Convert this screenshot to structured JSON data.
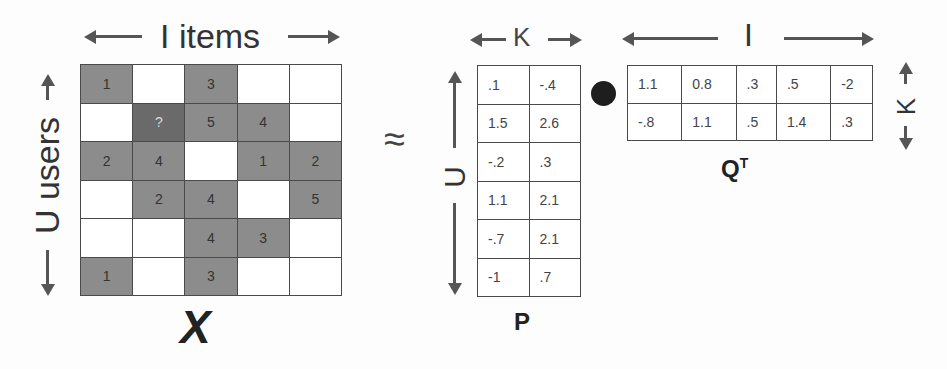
{
  "X": {
    "top_label": "I items",
    "side_label": "U users",
    "name": "X",
    "cells": [
      [
        {
          "v": "1",
          "t": "filled"
        },
        {
          "v": "",
          "t": "empty"
        },
        {
          "v": "3",
          "t": "filled"
        },
        {
          "v": "",
          "t": "empty"
        },
        {
          "v": "",
          "t": "empty"
        }
      ],
      [
        {
          "v": "",
          "t": "empty"
        },
        {
          "v": "?",
          "t": "query"
        },
        {
          "v": "5",
          "t": "filled"
        },
        {
          "v": "4",
          "t": "filled"
        },
        {
          "v": "",
          "t": "empty"
        }
      ],
      [
        {
          "v": "2",
          "t": "filled"
        },
        {
          "v": "4",
          "t": "filled"
        },
        {
          "v": "",
          "t": "empty"
        },
        {
          "v": "1",
          "t": "filled"
        },
        {
          "v": "2",
          "t": "filled"
        }
      ],
      [
        {
          "v": "",
          "t": "empty"
        },
        {
          "v": "2",
          "t": "filled"
        },
        {
          "v": "4",
          "t": "filled"
        },
        {
          "v": "",
          "t": "empty"
        },
        {
          "v": "5",
          "t": "filled"
        }
      ],
      [
        {
          "v": "",
          "t": "empty"
        },
        {
          "v": "",
          "t": "empty"
        },
        {
          "v": "4",
          "t": "filled"
        },
        {
          "v": "3",
          "t": "filled"
        },
        {
          "v": "",
          "t": "empty"
        }
      ],
      [
        {
          "v": "1",
          "t": "filled"
        },
        {
          "v": "",
          "t": "empty"
        },
        {
          "v": "3",
          "t": "filled"
        },
        {
          "v": "",
          "t": "empty"
        },
        {
          "v": "",
          "t": "empty"
        }
      ]
    ]
  },
  "approx_symbol": "≈",
  "P": {
    "top_label": "K",
    "side_label": "U",
    "name": "P",
    "cells": [
      [
        ".1",
        "-.4"
      ],
      [
        "1.5",
        "2.6"
      ],
      [
        "-.2",
        ".3"
      ],
      [
        "1.1",
        "2.1"
      ],
      [
        "-.7",
        "2.1"
      ],
      [
        "-1",
        ".7"
      ]
    ]
  },
  "dot_symbol": "●",
  "QT": {
    "top_label": "I",
    "side_label": "K",
    "name": "Q",
    "superscript": "T",
    "cells": [
      [
        "1.1",
        "0.8",
        ".3",
        ".5",
        "-2"
      ],
      [
        "-.8",
        "1.1",
        ".5",
        "1.4",
        ".3"
      ]
    ]
  },
  "colors": {
    "filled": "#8c8c8c",
    "query": "#6a6a6a",
    "line": "#4a4a4a",
    "arrow": "#555555"
  }
}
